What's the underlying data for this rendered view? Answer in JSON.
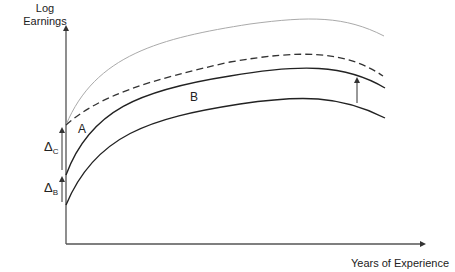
{
  "diagram": {
    "type": "earnings-experience profile",
    "y_axis_label_line1": "Log",
    "y_axis_label_line2": "Earnings",
    "x_axis_label": "Years of Experience",
    "region_labels": {
      "a": "A",
      "b": "B"
    },
    "deltas": {
      "c": {
        "symbol": "Δ",
        "subscript": "C"
      },
      "b": {
        "symbol": "Δ",
        "subscript": "B"
      }
    },
    "curves": [
      {
        "name": "top-gray-curve",
        "style": "solid-light-gray",
        "color": "#aaaaaa"
      },
      {
        "name": "dashed-curve",
        "style": "dashed",
        "color": "#333333"
      },
      {
        "name": "middle-curve",
        "style": "solid",
        "color": "#222222"
      },
      {
        "name": "bottom-curve",
        "style": "solid",
        "color": "#222222"
      }
    ],
    "colors": {
      "axis": "#333333",
      "text": "#222222",
      "light_curve": "#aaaaaa"
    }
  }
}
